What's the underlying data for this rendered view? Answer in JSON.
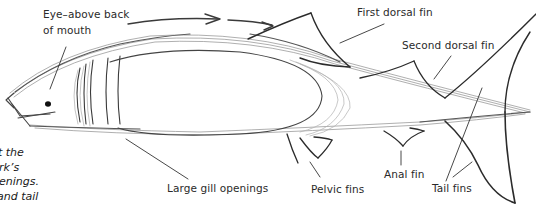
{
  "diagram": {
    "labels": {
      "eye_line1": "Eye–above back",
      "eye_line2": "of mouth",
      "first_dorsal": "First dorsal fin",
      "second_dorsal": "Second dorsal fin",
      "gills": "Large gill openings",
      "pelvic": "Pelvic fins",
      "anal": "Anal fin",
      "tail": "Tail fins"
    },
    "caption_fragments": [
      "t the",
      "rk’s",
      "enings.",
      " and tail"
    ],
    "colors": {
      "stroke_dark": "#2b2b2b",
      "stroke_light": "#a8a8a8",
      "text": "#2a2a2a"
    }
  }
}
